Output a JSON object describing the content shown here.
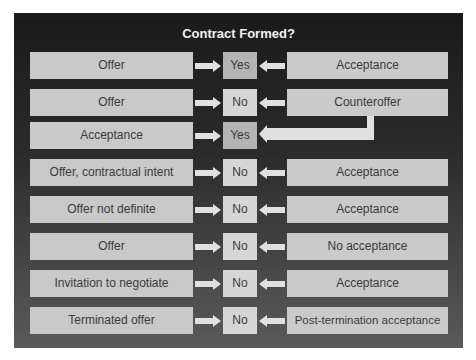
{
  "title": "Contract Formed?",
  "colors": {
    "panel_top": "#1a1a1a",
    "panel_bottom": "#5a5a5a",
    "box": "#c9c9c9",
    "result_no": "#d6d6d6",
    "result_yes": "#b4b4b4",
    "arrow": "#e0e0e0"
  },
  "rows": [
    {
      "left": "Offer",
      "result": "Yes",
      "right": "Acceptance"
    },
    {
      "left": "Offer",
      "result": "No",
      "right": "Counteroffer"
    },
    {
      "left": "Acceptance",
      "result": "Yes",
      "right": null,
      "note": "arrow from Counteroffer"
    },
    {
      "left": "Offer, contractual intent",
      "result": "No",
      "right": "Acceptance"
    },
    {
      "left": "Offer not definite",
      "result": "No",
      "right": "Acceptance"
    },
    {
      "left": "Offer",
      "result": "No",
      "right": "No acceptance"
    },
    {
      "left": "Invitation to negotiate",
      "result": "No",
      "right": "Acceptance"
    },
    {
      "left": "Terminated offer",
      "result": "No",
      "right": "Post-termination acceptance"
    }
  ]
}
